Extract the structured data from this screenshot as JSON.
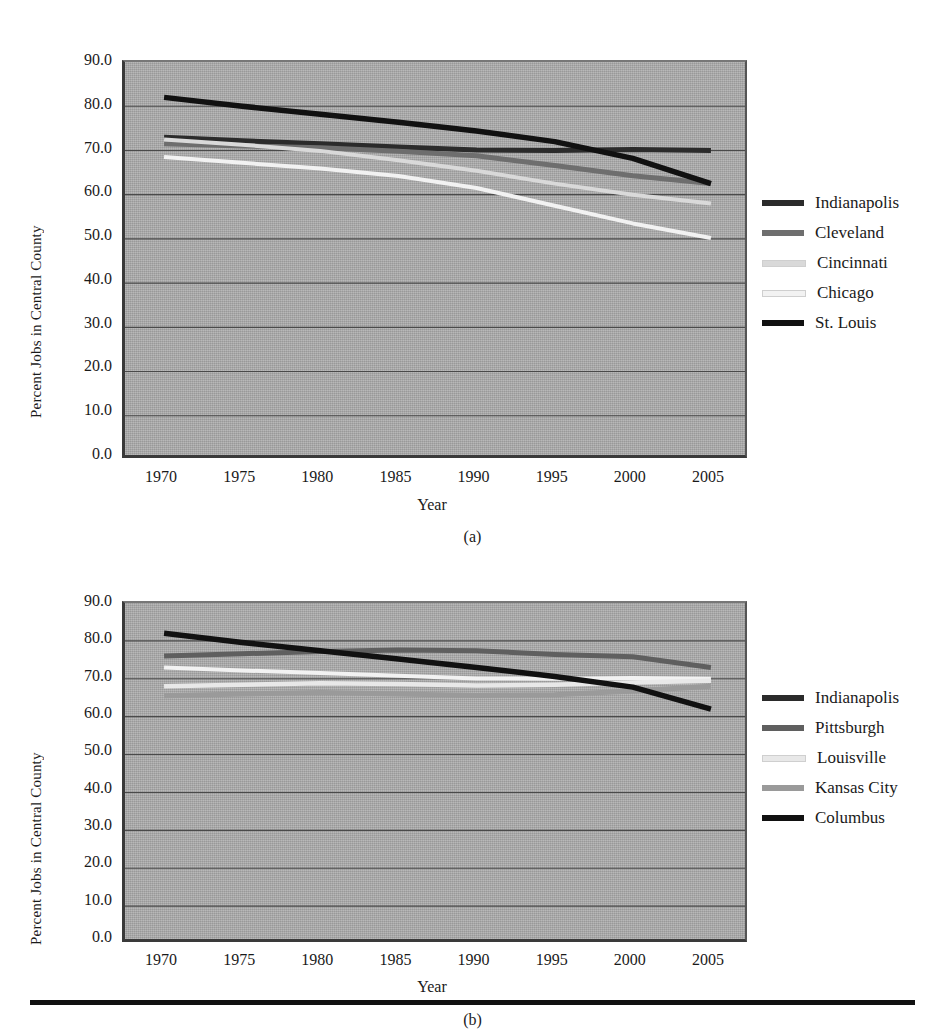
{
  "figure": {
    "captions": {
      "a": "(a)",
      "b": "(b)"
    }
  },
  "axes": {
    "ylabel": "Percent Jobs in Central County",
    "xlabel": "Year",
    "yticks": [
      "90.0",
      "80.0",
      "70.0",
      "60.0",
      "50.0",
      "40.0",
      "30.0",
      "20.0",
      "10.0",
      "0.0"
    ],
    "xticks": [
      "1970",
      "1975",
      "1980",
      "1985",
      "1990",
      "1995",
      "2000",
      "2005"
    ]
  },
  "colors": {
    "indianapolis": "#2b2b2b",
    "cleveland": "#6e6e6e",
    "cincinnati": "#d9d9d9",
    "chicago": "#f2f2f2",
    "stlouis": "#111111",
    "pittsburgh": "#5f5f5f",
    "louisville": "#e8e8e8",
    "kansascity": "#9a9a9a",
    "columbus": "#111111",
    "plot_background": "#a8a8a8",
    "gridline": "#4a4a4a",
    "axis": "#3a3a3a"
  },
  "legend_a": [
    {
      "label": "Indianapolis",
      "color_key": "indianapolis"
    },
    {
      "label": "Cleveland",
      "color_key": "cleveland"
    },
    {
      "label": "Cincinnati",
      "color_key": "cincinnati"
    },
    {
      "label": "Chicago",
      "color_key": "chicago"
    },
    {
      "label": "St. Louis",
      "color_key": "stlouis"
    }
  ],
  "legend_b": [
    {
      "label": "Indianapolis",
      "color_key": "indianapolis"
    },
    {
      "label": "Pittsburgh",
      "color_key": "pittsburgh"
    },
    {
      "label": "Louisville",
      "color_key": "louisville"
    },
    {
      "label": "Kansas City",
      "color_key": "kansascity"
    },
    {
      "label": "Columbus",
      "color_key": "columbus"
    }
  ],
  "chart_data": [
    {
      "id": "a",
      "type": "line",
      "title": "",
      "caption": "(a)",
      "xlabel": "Year",
      "ylabel": "Percent Jobs in Central County",
      "x": [
        1970,
        1975,
        1980,
        1985,
        1990,
        1995,
        2000,
        2005
      ],
      "xlim": [
        1967.5,
        2007.5
      ],
      "ylim": [
        0.0,
        90.0
      ],
      "ytick_step": 10.0,
      "grid": true,
      "legend_position": "right",
      "series": [
        {
          "name": "Indianapolis",
          "color": "#2b2b2b",
          "width": 5.0,
          "values": [
            73.0,
            72.2,
            71.5,
            70.8,
            70.1,
            70.0,
            70.2,
            70.0
          ]
        },
        {
          "name": "Cleveland",
          "color": "#6e6e6e",
          "width": 5.0,
          "values": [
            71.5,
            71.0,
            70.6,
            69.8,
            68.8,
            66.6,
            64.3,
            62.5
          ]
        },
        {
          "name": "Cincinnati",
          "color": "#d9d9d9",
          "width": 4.0,
          "values": [
            72.5,
            71.3,
            69.9,
            67.8,
            65.4,
            62.5,
            60.0,
            58.0
          ]
        },
        {
          "name": "Chicago",
          "color": "#f2f2f2",
          "width": 4.0,
          "values": [
            68.5,
            67.2,
            65.9,
            64.2,
            61.5,
            57.5,
            53.5,
            50.2
          ]
        },
        {
          "name": "St. Louis",
          "color": "#111111",
          "width": 5.5,
          "values": [
            82.0,
            80.0,
            78.2,
            76.4,
            74.4,
            72.0,
            68.2,
            62.5
          ]
        }
      ]
    },
    {
      "id": "b",
      "type": "line",
      "title": "",
      "caption": "(b)",
      "xlabel": "Year",
      "ylabel": "Percent Jobs in Central County",
      "x": [
        1970,
        1975,
        1980,
        1985,
        1990,
        1995,
        2000,
        2005
      ],
      "xlim": [
        1967.5,
        2007.5
      ],
      "ylim": [
        0.0,
        90.0
      ],
      "ytick_step": 10.0,
      "grid": true,
      "legend_position": "right",
      "series": [
        {
          "name": "Indianapolis",
          "color": "#f2f2f2",
          "width": 4.0,
          "values": [
            73.0,
            72.2,
            71.5,
            70.8,
            70.1,
            70.0,
            70.2,
            70.0
          ]
        },
        {
          "name": "Pittsburgh",
          "color": "#5f5f5f",
          "width": 5.0,
          "values": [
            76.0,
            76.6,
            77.2,
            77.6,
            77.4,
            76.4,
            75.8,
            73.0
          ]
        },
        {
          "name": "Louisville",
          "color": "#e8e8e8",
          "width": 4.5,
          "values": [
            68.0,
            68.4,
            68.8,
            68.6,
            68.2,
            68.4,
            69.0,
            69.5
          ]
        },
        {
          "name": "Kansas City",
          "color": "#9a9a9a",
          "width": 5.0,
          "values": [
            65.5,
            66.0,
            66.4,
            66.0,
            65.6,
            65.8,
            66.8,
            68.0
          ]
        },
        {
          "name": "Columbus",
          "color": "#111111",
          "width": 5.5,
          "values": [
            82.0,
            79.6,
            77.4,
            75.2,
            73.0,
            70.6,
            67.8,
            62.0
          ]
        }
      ]
    }
  ]
}
